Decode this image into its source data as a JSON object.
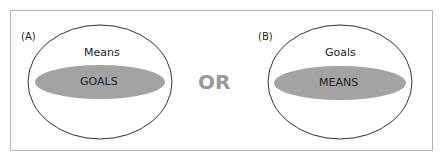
{
  "diagram": {
    "panel_a": {
      "label": "(A)",
      "outer": "Means",
      "inner": "GOALS"
    },
    "panel_b": {
      "label": "(B)",
      "outer": "Goals",
      "inner": "MEANS"
    },
    "connector": "OR",
    "colors": {
      "inner_fill": "#a3a3a3",
      "outline": "#333333",
      "or_text": "#9a9a9a",
      "frame": "#b5b5b5"
    }
  }
}
